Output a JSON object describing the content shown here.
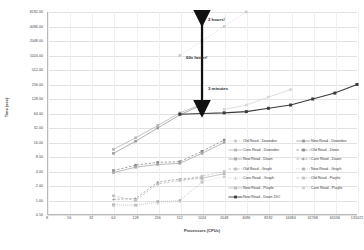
{
  "chart_data": {
    "type": "line",
    "title": "",
    "xlabel": "Processors (CPUs)",
    "ylabel": "Time (sec)",
    "xscale": "log2",
    "yscale": "log2",
    "xticks": [
      8,
      16,
      32,
      64,
      128,
      256,
      512,
      1024,
      2048,
      4096,
      8192,
      16384,
      32768,
      65536,
      131072
    ],
    "xticklabels": [
      "8",
      "16",
      "32",
      "64",
      "128",
      "256",
      "512",
      "1024",
      "2048",
      "4096",
      "8192",
      "16384",
      "32768",
      "65536",
      "131072"
    ],
    "yticks": [
      8192,
      4096,
      2048,
      1024,
      512,
      256,
      128,
      64,
      32,
      16,
      8,
      4,
      2,
      1,
      0.5
    ],
    "yticklabels": [
      "8192.00",
      "4096.00",
      "2048.00",
      "1024.00",
      "512.00",
      "256.00",
      "128.00",
      "64.00",
      "32.00",
      "16.00",
      "8.00",
      "4.00",
      "2.00",
      "1.00",
      "0.50"
    ],
    "xlim": [
      8,
      131072
    ],
    "ylim": [
      0.5,
      8192
    ],
    "grid": true,
    "legend_position": "inside-lower-right",
    "annotations": [
      {
        "text": "2 hours!",
        "x": 2048,
        "y": 6000
      },
      {
        "text": "60x faster!",
        "x": 1100,
        "y": 300
      },
      {
        "text": "3 minutes",
        "x": 2048,
        "y": 110
      }
    ],
    "series": [
      {
        "name": "Old Read - Downdev",
        "color": "#c9c9c9",
        "style": "dotted",
        "marker": "square",
        "x": [
          512,
          1024,
          2048,
          4096
        ],
        "y": [
          1024,
          2048,
          4096,
          8192
        ]
      },
      {
        "name": "New Read - Downdev",
        "color": "#9a9a9a",
        "style": "solid",
        "marker": "square",
        "x": [
          64,
          128,
          256,
          512,
          1024
        ],
        "y": [
          9.5,
          17,
          32,
          60,
          96
        ]
      },
      {
        "name": "Core Read - Downdev",
        "color": "#b5b5b5",
        "style": "solid",
        "marker": "square",
        "x": [
          64,
          128,
          256,
          512,
          1024
        ],
        "y": [
          11.5,
          20,
          36,
          66,
          100
        ]
      },
      {
        "name": "Old Read - Down",
        "color": "#8e8e8e",
        "style": "dashed",
        "marker": "square",
        "x": [
          64,
          128,
          256,
          512,
          1024,
          2048
        ],
        "y": [
          4.2,
          5.4,
          6.2,
          6.4,
          10.5,
          18
        ]
      },
      {
        "name": "New Read - Down",
        "color": "#a8a8a8",
        "style": "solid",
        "marker": "square",
        "x": [
          64,
          128,
          256,
          512,
          1024,
          2048
        ],
        "y": [
          3.8,
          4.9,
          5.6,
          5.9,
          9.5,
          16
        ]
      },
      {
        "name": "Core Read - Down",
        "color": "#9f9f9f",
        "style": "dashed",
        "marker": "diamond",
        "x": [
          64,
          128,
          256,
          512,
          1024
        ],
        "y": [
          1.05,
          1.1,
          2.4,
          2.8,
          3.0
        ]
      },
      {
        "name": "Old Read - Graph",
        "color": "#bdbdbd",
        "style": "dashed",
        "marker": "square",
        "x": [
          64,
          128,
          256,
          512,
          1024
        ],
        "y": [
          1.25,
          1.0,
          2.2,
          2.6,
          2.9
        ]
      },
      {
        "name": "New Read - Graph",
        "color": "#b0b0b0",
        "style": "dotted",
        "marker": "square",
        "x": [
          64,
          128,
          256,
          512,
          1024
        ],
        "y": [
          0.82,
          0.8,
          0.95,
          1.0,
          2.4
        ]
      },
      {
        "name": "Core Read - Graph",
        "color": "#cfcfcf",
        "style": "dotted",
        "marker": "triangle",
        "x": [
          64,
          128,
          256,
          512
        ],
        "y": [
          0.78,
          0.78,
          0.88,
          0.95
        ]
      },
      {
        "name": "Old Read - Purple",
        "color": "#c4c4c4",
        "style": "dashed",
        "marker": "square",
        "x": [
          512,
          1024,
          2048
        ],
        "y": [
          2.6,
          3.2,
          4.0
        ]
      },
      {
        "name": "New Read - Purple",
        "color": "#bababa",
        "style": "solid",
        "marker": "square",
        "x": [
          1024,
          2048
        ],
        "y": [
          2.9,
          3.6
        ]
      },
      {
        "name": "Core Read - Purple",
        "color": "#d2d2d2",
        "style": "dotted",
        "marker": "square",
        "x": [
          1024,
          2048
        ],
        "y": [
          2.5,
          3.1
        ]
      },
      {
        "name": "New Read - Down DIO",
        "color": "#3a3a3a",
        "style": "solid",
        "marker": "square",
        "x": [
          512,
          1024,
          2048,
          4096,
          8192,
          16384,
          32768,
          65536,
          131072
        ],
        "y": [
          62,
          64,
          66,
          70,
          82,
          96,
          128,
          170,
          256
        ]
      },
      {
        "name": "Light upper trail",
        "color": "#d6d6d6",
        "style": "solid",
        "marker": "square",
        "x": [
          2048,
          4096,
          8192,
          16384
        ],
        "y": [
          78,
          96,
          140,
          200
        ]
      }
    ]
  },
  "axis": {
    "x_title": "Processors (CPUs)",
    "y_title": "Time (sec)"
  },
  "legend": {
    "rows": [
      [
        {
          "label": "Old Read - Downdev",
          "color": "#c9c9c9",
          "style": "dotted",
          "marker": "square"
        },
        {
          "label": "New Read - Downdev",
          "color": "#9a9a9a",
          "style": "solid",
          "marker": "square"
        }
      ],
      [
        {
          "label": "Core Read - Downdev",
          "color": "#b5b5b5",
          "style": "solid",
          "marker": "square"
        },
        {
          "label": "Old Read - Down",
          "color": "#8e8e8e",
          "style": "dashed",
          "marker": "square"
        }
      ],
      [
        {
          "label": "New Read - Down",
          "color": "#a8a8a8",
          "style": "solid",
          "marker": "square"
        },
        {
          "label": "Core Read - Down",
          "color": "#9f9f9f",
          "style": "dashed",
          "marker": "diamond"
        }
      ],
      [
        {
          "label": "Old Read - Graph",
          "color": "#bdbdbd",
          "style": "dashed",
          "marker": "square"
        },
        {
          "label": "New Read - Graph",
          "color": "#b0b0b0",
          "style": "dotted",
          "marker": "square"
        }
      ],
      [
        {
          "label": "Core Read - Graph",
          "color": "#cfcfcf",
          "style": "dotted",
          "marker": "triangle"
        },
        {
          "label": "Old Read - Purple",
          "color": "#c4c4c4",
          "style": "dashed",
          "marker": "square"
        }
      ],
      [
        {
          "label": "New Read - Purple",
          "color": "#bababa",
          "style": "solid",
          "marker": "square"
        },
        {
          "label": "Core Read - Purple",
          "color": "#d2d2d2",
          "style": "dotted",
          "marker": "square"
        }
      ],
      [
        {
          "label": "New Read - Down DIO",
          "color": "#3a3a3a",
          "style": "solid",
          "marker": "square"
        }
      ]
    ]
  }
}
